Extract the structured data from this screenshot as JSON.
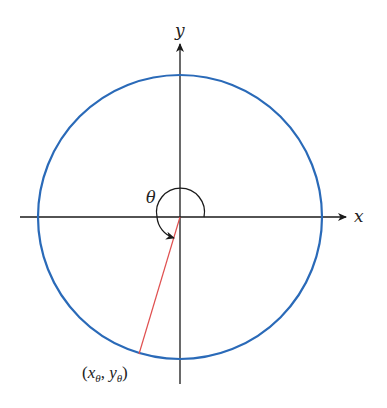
{
  "diagram": {
    "type": "unit-circle-angle",
    "axes": {
      "x_label": "x",
      "y_label": "y"
    },
    "angle_label": "θ",
    "point_label": {
      "open": "(",
      "x": "x",
      "x_sub": "θ",
      "sep": ", ",
      "y": "y",
      "y_sub": "θ",
      "close": ")"
    },
    "colors": {
      "circle": "#2a6ab8",
      "radius": "#e05050",
      "axes": "#1a1a1a"
    }
  }
}
